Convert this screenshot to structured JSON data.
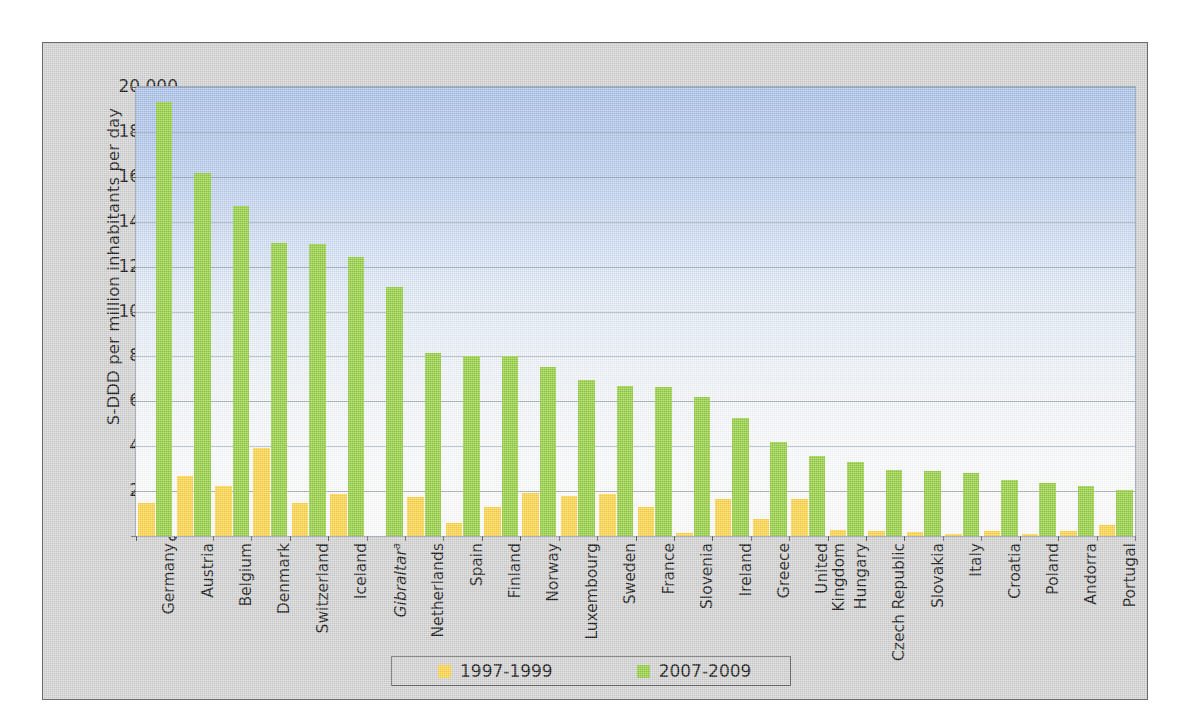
{
  "chart_data": {
    "type": "bar",
    "title": "",
    "xlabel": "",
    "ylabel": "S-DDD per million inhabitants per day",
    "ylim": [
      0,
      20000
    ],
    "yticks": [
      "0",
      "2 000",
      "4 000",
      "6 000",
      "8 000",
      "10 000",
      "12 000",
      "14 000",
      "16 000",
      "18 000",
      "20 000"
    ],
    "grid": true,
    "legend_position": "bottom",
    "categories": [
      "Germany",
      "Austria",
      "Belgium",
      "Denmark",
      "Switzerland",
      "Iceland",
      "Gibraltar",
      "Netherlands",
      "Spain",
      "Finland",
      "Norway",
      "Luxembourg",
      "Sweden",
      "France",
      "Slovenia",
      "Ireland",
      "Greece",
      "United Kingdom",
      "Hungary",
      "Czech Republic",
      "Slovakia",
      "Italy",
      "Croatia",
      "Poland",
      "Andorra",
      "Portugal"
    ],
    "category_labels": [
      [
        "Germany"
      ],
      [
        "Austria"
      ],
      [
        "Belgium"
      ],
      [
        "Denmark"
      ],
      [
        "Switzerland"
      ],
      [
        "Iceland"
      ],
      [
        "Gibraltar"
      ],
      [
        "Netherlands"
      ],
      [
        "Spain"
      ],
      [
        "Finland"
      ],
      [
        "Norway"
      ],
      [
        "Luxembourg"
      ],
      [
        "Sweden"
      ],
      [
        "France"
      ],
      [
        "Slovenia"
      ],
      [
        "Ireland"
      ],
      [
        "Greece"
      ],
      [
        "United",
        "Kingdom"
      ],
      [
        "Hungary"
      ],
      [
        "Czech Republic"
      ],
      [
        "Slovakia"
      ],
      [
        "Italy"
      ],
      [
        "Croatia"
      ],
      [
        "Poland"
      ],
      [
        "Andorra"
      ],
      [
        "Portugal"
      ]
    ],
    "category_footnote_index": 6,
    "category_footnote_mark": "a",
    "series": [
      {
        "name": "1997-1999",
        "color": "#ffd444",
        "values": [
          1480,
          2680,
          2250,
          3900,
          1450,
          1880,
          0,
          1750,
          560,
          1300,
          1900,
          1800,
          1880,
          1300,
          130,
          1640,
          740,
          1640,
          250,
          240,
          180,
          90,
          230,
          110,
          220,
          470
        ]
      },
      {
        "name": "2007-2009",
        "color": "#93ce3e",
        "values": [
          19350,
          16150,
          14700,
          13050,
          13000,
          12450,
          11100,
          8150,
          8000,
          8000,
          7550,
          6950,
          6700,
          6650,
          6200,
          5250,
          4200,
          3550,
          3300,
          2950,
          2900,
          2820,
          2500,
          2370,
          2220,
          2040
        ]
      }
    ]
  },
  "legend": {
    "items": [
      {
        "label": "1997-1999",
        "color": "#ffd444"
      },
      {
        "label": "2007-2009",
        "color": "#93ce3e"
      }
    ]
  }
}
